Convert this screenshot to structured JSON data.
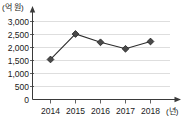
{
  "chart_data": {
    "type": "line",
    "title": "",
    "subtitle": "",
    "xlabel": "(년)",
    "ylabel": "(억 원)",
    "categories": [
      "2014",
      "2015",
      "2016",
      "2017",
      "2018"
    ],
    "x": [
      2014,
      2015,
      2016,
      2017,
      2018
    ],
    "values": [
      1540,
      2520,
      2200,
      1950,
      2230
    ],
    "series": [
      {
        "name": "금액",
        "values": [
          1540,
          2520,
          2200,
          1950,
          2230
        ]
      }
    ],
    "ylim": [
      0,
      3000
    ],
    "yticks": [
      0,
      500,
      1000,
      1500,
      2000,
      2500,
      3000
    ],
    "ytick_labels": [
      "0",
      "500",
      "1,000",
      "1,500",
      "2,000",
      "2,500",
      "3,000"
    ],
    "xtick_labels": [
      "2014",
      "2015",
      "2016",
      "2017",
      "2018"
    ],
    "grid": true,
    "grid_axis": "y",
    "legend": false,
    "legend_position": "none",
    "marker": "diamond",
    "annotations": [],
    "colors": {
      "line": "#2b2b2b",
      "marker_fill": "#4a4a4a",
      "marker_edge": "#1f1f1f",
      "grid": "#c8c8c8",
      "axis": "#3a3a3a",
      "background": "#ffffff",
      "text": "#1a1a1a"
    }
  },
  "axes": {
    "y_unit_label": "(억 원)",
    "x_unit_label": "(년)"
  },
  "ytick_labels": {
    "t0": "3,000",
    "t1": "2,500",
    "t2": "2,000",
    "t3": "1,500",
    "t4": "1,000",
    "t5": "500",
    "t6": "0"
  },
  "xtick_labels": {
    "t0": "2014",
    "t1": "2015",
    "t2": "2016",
    "t3": "2017",
    "t4": "2018"
  }
}
